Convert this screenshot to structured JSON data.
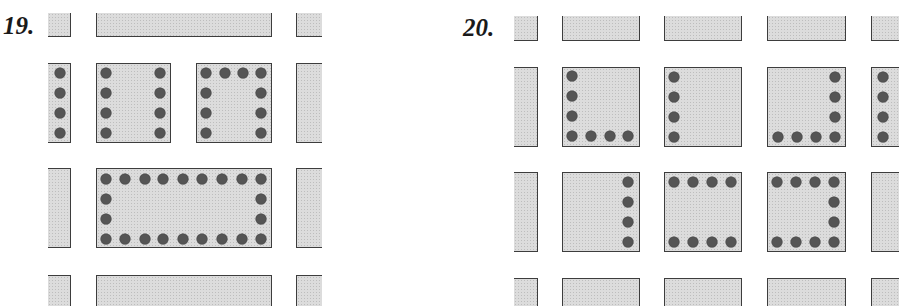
{
  "page_header_fragment": "",
  "puzzles": [
    {
      "number": "19.",
      "label_pos": [
        3,
        13
      ],
      "tiles": [
        {
          "id": "p19-top-left-partial",
          "x": 48,
          "y": 13,
          "w": 23,
          "h": 24,
          "open": [
            "left",
            "top"
          ],
          "dots": []
        },
        {
          "id": "p19-top-wide",
          "x": 96,
          "y": 13,
          "w": 176,
          "h": 24,
          "open": [
            "top"
          ],
          "dots": []
        },
        {
          "id": "p19-top-right-partial",
          "x": 296,
          "y": 13,
          "w": 26,
          "h": 24,
          "open": [
            "right",
            "top"
          ],
          "dots": []
        },
        {
          "id": "p19-row2-left-partial",
          "x": 48,
          "y": 63,
          "w": 23,
          "h": 80,
          "open": [
            "left"
          ],
          "dots": [
            [
              60,
              73
            ],
            [
              60,
              93
            ],
            [
              60,
              113
            ],
            [
              60,
              133
            ]
          ]
        },
        {
          "id": "p19-row2-square-a",
          "x": 96,
          "y": 63,
          "w": 75,
          "h": 80,
          "open": [],
          "dots": [
            [
              106,
              73
            ],
            [
              106,
              93
            ],
            [
              106,
              113
            ],
            [
              106,
              133
            ],
            [
              160,
              73
            ],
            [
              160,
              93
            ],
            [
              160,
              113
            ],
            [
              160,
              133
            ]
          ]
        },
        {
          "id": "p19-row2-square-b",
          "x": 196,
          "y": 63,
          "w": 76,
          "h": 80,
          "open": [],
          "dots": [
            [
              206,
              73
            ],
            [
              225,
              73
            ],
            [
              243,
              73
            ],
            [
              261,
              73
            ],
            [
              206,
              93
            ],
            [
              206,
              113
            ],
            [
              206,
              133
            ],
            [
              261,
              93
            ],
            [
              261,
              113
            ],
            [
              261,
              133
            ]
          ]
        },
        {
          "id": "p19-row2-right-partial",
          "x": 296,
          "y": 63,
          "w": 26,
          "h": 80,
          "open": [
            "right"
          ],
          "dots": []
        },
        {
          "id": "p19-row3-left-partial",
          "x": 48,
          "y": 168,
          "w": 23,
          "h": 80,
          "open": [
            "left"
          ],
          "dots": []
        },
        {
          "id": "p19-row3-wide",
          "x": 96,
          "y": 168,
          "w": 176,
          "h": 80,
          "open": [],
          "dots": [
            [
              106,
              179
            ],
            [
              125,
              179
            ],
            [
              145,
              179
            ],
            [
              163,
              179
            ],
            [
              183,
              179
            ],
            [
              202,
              179
            ],
            [
              222,
              179
            ],
            [
              242,
              179
            ],
            [
              261,
              179
            ],
            [
              106,
              199
            ],
            [
              106,
              219
            ],
            [
              261,
              199
            ],
            [
              261,
              219
            ],
            [
              106,
              239
            ],
            [
              125,
              239
            ],
            [
              145,
              239
            ],
            [
              163,
              239
            ],
            [
              183,
              239
            ],
            [
              202,
              239
            ],
            [
              222,
              239
            ],
            [
              242,
              239
            ],
            [
              261,
              239
            ]
          ]
        },
        {
          "id": "p19-row3-right-partial",
          "x": 296,
          "y": 168,
          "w": 26,
          "h": 80,
          "open": [
            "right"
          ],
          "dots": []
        },
        {
          "id": "p19-bottom-left-partial",
          "x": 48,
          "y": 275,
          "w": 23,
          "h": 31,
          "open": [
            "left",
            "bottom"
          ],
          "dots": []
        },
        {
          "id": "p19-bottom-wide",
          "x": 96,
          "y": 275,
          "w": 176,
          "h": 31,
          "open": [
            "bottom"
          ],
          "dots": []
        },
        {
          "id": "p19-bottom-right-partial",
          "x": 296,
          "y": 275,
          "w": 26,
          "h": 31,
          "open": [
            "right",
            "bottom"
          ],
          "dots": []
        }
      ]
    },
    {
      "number": "20.",
      "label_pos": [
        463,
        15
      ],
      "tiles": [
        {
          "id": "p20-top-left-partial",
          "x": 514,
          "y": 16,
          "w": 24,
          "h": 25,
          "open": [
            "left",
            "top"
          ],
          "dots": []
        },
        {
          "id": "p20-top-1",
          "x": 562,
          "y": 16,
          "w": 78,
          "h": 25,
          "open": [
            "top"
          ],
          "dots": []
        },
        {
          "id": "p20-top-2",
          "x": 664,
          "y": 16,
          "w": 78,
          "h": 25,
          "open": [
            "top"
          ],
          "dots": []
        },
        {
          "id": "p20-top-3",
          "x": 767,
          "y": 16,
          "w": 79,
          "h": 25,
          "open": [
            "top"
          ],
          "dots": []
        },
        {
          "id": "p20-top-right-partial",
          "x": 871,
          "y": 16,
          "w": 28,
          "h": 25,
          "open": [
            "right",
            "top"
          ],
          "dots": []
        },
        {
          "id": "p20-row2-left-partial",
          "x": 514,
          "y": 67,
          "w": 24,
          "h": 80,
          "open": [
            "left"
          ],
          "dots": []
        },
        {
          "id": "p20-row2-square-1",
          "x": 562,
          "y": 67,
          "w": 78,
          "h": 80,
          "open": [],
          "dots": [
            [
              572,
              76
            ],
            [
              572,
              96
            ],
            [
              572,
              116
            ],
            [
              572,
              136
            ],
            [
              591,
              136
            ],
            [
              610,
              136
            ],
            [
              628,
              136
            ]
          ]
        },
        {
          "id": "p20-row2-square-2",
          "x": 664,
          "y": 67,
          "w": 78,
          "h": 80,
          "open": [],
          "dots": [
            [
              674,
              77
            ],
            [
              674,
              97
            ],
            [
              674,
              117
            ],
            [
              674,
              137
            ]
          ]
        },
        {
          "id": "p20-row2-square-3",
          "x": 767,
          "y": 67,
          "w": 79,
          "h": 80,
          "open": [],
          "dots": [
            [
              835,
              77
            ],
            [
              835,
              97
            ],
            [
              835,
              117
            ],
            [
              778,
              137
            ],
            [
              797,
              137
            ],
            [
              816,
              137
            ],
            [
              835,
              137
            ]
          ]
        },
        {
          "id": "p20-row2-right-partial",
          "x": 871,
          "y": 67,
          "w": 28,
          "h": 80,
          "open": [
            "right"
          ],
          "dots": [
            [
              883,
              77
            ],
            [
              883,
              97
            ],
            [
              883,
              117
            ],
            [
              883,
              137
            ]
          ]
        },
        {
          "id": "p20-row3-left-partial",
          "x": 514,
          "y": 172,
          "w": 24,
          "h": 80,
          "open": [
            "left"
          ],
          "dots": []
        },
        {
          "id": "p20-row3-square-1",
          "x": 562,
          "y": 172,
          "w": 78,
          "h": 80,
          "open": [],
          "dots": [
            [
              628,
              182
            ],
            [
              628,
              202
            ],
            [
              628,
              222
            ],
            [
              628,
              242
            ]
          ]
        },
        {
          "id": "p20-row3-square-2",
          "x": 664,
          "y": 172,
          "w": 78,
          "h": 80,
          "open": [],
          "dots": [
            [
              674,
              182
            ],
            [
              693,
              182
            ],
            [
              712,
              182
            ],
            [
              731,
              182
            ],
            [
              674,
              242
            ],
            [
              693,
              242
            ],
            [
              712,
              242
            ],
            [
              731,
              242
            ]
          ]
        },
        {
          "id": "p20-row3-square-3",
          "x": 767,
          "y": 172,
          "w": 79,
          "h": 80,
          "open": [],
          "dots": [
            [
              777,
              182
            ],
            [
              796,
              182
            ],
            [
              815,
              182
            ],
            [
              834,
              182
            ],
            [
              834,
              202
            ],
            [
              834,
              222
            ],
            [
              777,
              242
            ],
            [
              796,
              242
            ],
            [
              815,
              242
            ],
            [
              834,
              242
            ]
          ]
        },
        {
          "id": "p20-row3-right-partial",
          "x": 871,
          "y": 172,
          "w": 28,
          "h": 80,
          "open": [
            "right"
          ],
          "dots": []
        },
        {
          "id": "p20-bottom-left-partial",
          "x": 514,
          "y": 278,
          "w": 24,
          "h": 28,
          "open": [
            "left",
            "bottom"
          ],
          "dots": []
        },
        {
          "id": "p20-bottom-1",
          "x": 562,
          "y": 278,
          "w": 78,
          "h": 28,
          "open": [
            "bottom"
          ],
          "dots": []
        },
        {
          "id": "p20-bottom-2",
          "x": 664,
          "y": 278,
          "w": 78,
          "h": 28,
          "open": [
            "bottom"
          ],
          "dots": []
        },
        {
          "id": "p20-bottom-3",
          "x": 767,
          "y": 278,
          "w": 79,
          "h": 28,
          "open": [
            "bottom"
          ],
          "dots": []
        },
        {
          "id": "p20-bottom-right-partial",
          "x": 871,
          "y": 278,
          "w": 28,
          "h": 28,
          "open": [
            "right",
            "bottom"
          ],
          "dots": []
        }
      ]
    }
  ],
  "colors": {
    "tile_fill": "#dcdcdc",
    "tile_border": "#3d3d3d",
    "dot": "#555555",
    "label": "#1a1a1a",
    "background": "#ffffff"
  }
}
